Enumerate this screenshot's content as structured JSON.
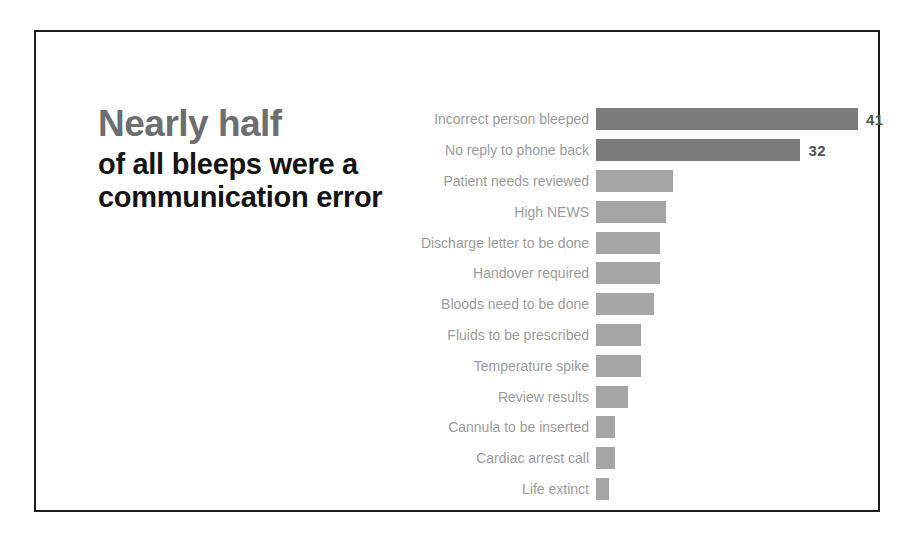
{
  "slide": {
    "title_highlight": "Nearly half",
    "title_rest_line1": "of all bleeps were a",
    "title_rest_line2": "communication error"
  },
  "chart_data": {
    "type": "bar",
    "orientation": "horizontal",
    "title": "Nearly half of all bleeps were a communication error",
    "categories": [
      "Incorrect person bleeped",
      "No reply to phone back",
      "Patient needs reviewed",
      "High NEWS",
      "Discharge letter to be done",
      "Handover required",
      "Bloods need to be done",
      "Fluids to be prescribed",
      "Temperature spike",
      "Review results",
      "Cannula to be inserted",
      "Cardiac arrest call",
      "Life extinct"
    ],
    "values": [
      41,
      32,
      12,
      11,
      10,
      10,
      9,
      7,
      7,
      5,
      3,
      3,
      2
    ],
    "data_labels": [
      "41",
      "32",
      "",
      "",
      "",
      "",
      "",
      "",
      "",
      "",
      "",
      "",
      ""
    ],
    "highlighted_categories": [
      "Incorrect person bleeped",
      "No reply to phone back"
    ],
    "xlim": [
      0,
      41
    ],
    "grid": false,
    "legend": false,
    "colors": {
      "highlight_bar": "#7c7c7c",
      "bar": "#a5a5a5",
      "category_text": "#9b9b9b",
      "value_text": "#515151",
      "title_highlight_text": "#6e6e6e",
      "title_text": "#141414",
      "border": "#1c1c1c",
      "background": "#ffffff"
    }
  }
}
